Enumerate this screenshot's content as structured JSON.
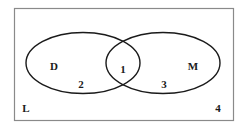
{
  "diagram": {
    "type": "venn",
    "universe": {
      "label": "L",
      "region_label": "4",
      "border_color": "#8a8a8a"
    },
    "sets": [
      {
        "name": "D",
        "region_label": "2"
      },
      {
        "name": "M",
        "region_label": "3"
      }
    ],
    "intersection": {
      "sets": [
        "D",
        "M"
      ],
      "region_label": "1"
    },
    "line_color": "#1a1a1a",
    "background": "#ffffff"
  }
}
